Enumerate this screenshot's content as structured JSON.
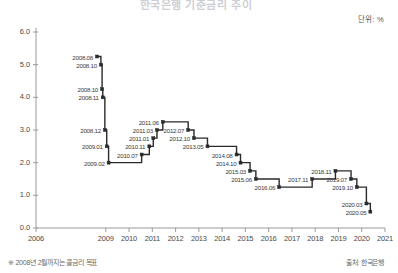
{
  "header": {
    "title": "한국은행 기준금리 추이",
    "unit_label": "단위: %"
  },
  "footer": {
    "footnote": "※ 2008년 2월까지는 콜금리 목표",
    "source": "출처: 한국은행"
  },
  "chart_data": {
    "type": "line",
    "step": "post",
    "title": "한국은행 기준금리 추이",
    "xlabel": "",
    "ylabel": "",
    "unit": "%",
    "ylim": [
      0.0,
      6.0
    ],
    "xlim": [
      2006.0,
      2021.0
    ],
    "grid": false,
    "legend": null,
    "line_color": "#2b2b2b",
    "marker_color": "#2b2b2b",
    "y_ticks": [
      "0.0",
      "1.0",
      "2.0",
      "3.0",
      "4.0",
      "5.0",
      "6.0"
    ],
    "y_tick_values": [
      0.0,
      1.0,
      2.0,
      3.0,
      4.0,
      5.0,
      6.0
    ],
    "x_ticks": [
      "2006",
      "2009",
      "2010",
      "2011",
      "2012",
      "2013",
      "2014",
      "2015",
      "2016",
      "2017",
      "2018",
      "2019",
      "2020",
      "2021"
    ],
    "x_tick_values": [
      2006,
      2009,
      2010,
      2011,
      2012,
      2013,
      2014,
      2015,
      2016,
      2017,
      2018,
      2019,
      2020,
      2021
    ],
    "points": [
      {
        "label": "2008.08",
        "x": 2008.62,
        "y": 5.25
      },
      {
        "label": "2008.10",
        "x": 2008.79,
        "y": 5.0
      },
      {
        "label": "2008.10",
        "x": 2008.84,
        "y": 4.25
      },
      {
        "label": "2008.11",
        "x": 2008.87,
        "y": 4.0
      },
      {
        "label": "2008.12",
        "x": 2008.96,
        "y": 3.0
      },
      {
        "label": "2009.01",
        "x": 2009.04,
        "y": 2.5
      },
      {
        "label": "2009.02",
        "x": 2009.12,
        "y": 2.0
      },
      {
        "label": "2010.07",
        "x": 2010.54,
        "y": 2.25
      },
      {
        "label": "2010.11",
        "x": 2010.87,
        "y": 2.5
      },
      {
        "label": "2011.01",
        "x": 2011.04,
        "y": 2.75
      },
      {
        "label": "2011.03",
        "x": 2011.2,
        "y": 3.0
      },
      {
        "label": "2011.06",
        "x": 2011.45,
        "y": 3.25
      },
      {
        "label": "2012.07",
        "x": 2012.54,
        "y": 3.0
      },
      {
        "label": "2012.10",
        "x": 2012.79,
        "y": 2.75
      },
      {
        "label": "2013.05",
        "x": 2013.37,
        "y": 2.5
      },
      {
        "label": "2014.08",
        "x": 2014.62,
        "y": 2.25
      },
      {
        "label": "2014.10",
        "x": 2014.79,
        "y": 2.0
      },
      {
        "label": "2015.03",
        "x": 2015.2,
        "y": 1.75
      },
      {
        "label": "2015.06",
        "x": 2015.45,
        "y": 1.5
      },
      {
        "label": "2016.06",
        "x": 2016.45,
        "y": 1.25
      },
      {
        "label": "2017.11",
        "x": 2017.87,
        "y": 1.5
      },
      {
        "label": "2018.11",
        "x": 2018.87,
        "y": 1.75
      },
      {
        "label": "2019.07",
        "x": 2019.54,
        "y": 1.5
      },
      {
        "label": "2019.10",
        "x": 2019.79,
        "y": 1.25
      },
      {
        "label": "2020.03",
        "x": 2020.2,
        "y": 0.75
      },
      {
        "label": "2020.05",
        "x": 2020.37,
        "y": 0.5
      }
    ]
  }
}
